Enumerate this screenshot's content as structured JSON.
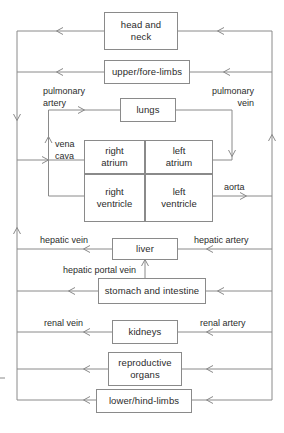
{
  "diagram": {
    "line_color": "#8a8a8a",
    "text_color": "#2b2b2b",
    "background": "#ffffff"
  },
  "organs": {
    "head_and_neck": "head and\nneck",
    "head_and_neck_line1": "head and",
    "head_and_neck_line2": "neck",
    "upper_fore_limbs": "upper/fore-limbs",
    "lungs": "lungs",
    "right_atrium_line1": "right",
    "right_atrium_line2": "atrium",
    "left_atrium_line1": "left",
    "left_atrium_line2": "atrium",
    "right_ventricle_line1": "right",
    "right_ventricle_line2": "ventricle",
    "left_ventricle_line1": "left",
    "left_ventricle_line2": "ventricle",
    "liver": "liver",
    "stomach_and_intestine": "stomach and intestine",
    "kidneys": "kidneys",
    "reproductive_organs_line1": "reproductive",
    "reproductive_organs_line2": "organs",
    "lower_hind_limbs": "lower/hind-limbs"
  },
  "vessels": {
    "pulmonary_artery_line1": "pulmonary",
    "pulmonary_artery_line2": "artery",
    "pulmonary_vein_line1": "pulmonary",
    "pulmonary_vein_line2": "vein",
    "vena_cava_line1": "vena",
    "vena_cava_line2": "cava",
    "aorta": "aorta",
    "hepatic_vein": "hepatic vein",
    "hepatic_artery": "hepatic artery",
    "hepatic_portal_vein": "hepatic portal vein",
    "renal_vein": "renal vein",
    "renal_artery": "renal artery"
  }
}
